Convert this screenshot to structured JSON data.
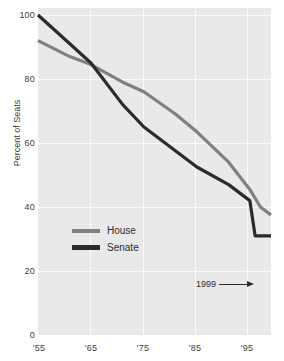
{
  "chart_data": {
    "type": "line",
    "title": "",
    "subtitle": "",
    "xlabel": "",
    "ylabel": "Percent of Seats",
    "xlim": [
      1955,
      1999
    ],
    "ylim": [
      0,
      100
    ],
    "grid": true,
    "legend_position": "inside-lower-left",
    "x_ticks": [
      "'55",
      "'65",
      "'75",
      "'85",
      "'95"
    ],
    "x_tick_values": [
      1955,
      1965,
      1975,
      1985,
      1995
    ],
    "y_ticks": [
      "0",
      "20",
      "40",
      "60",
      "80",
      "100"
    ],
    "y_tick_values": [
      0,
      20,
      40,
      60,
      80,
      100
    ],
    "annotations": [
      {
        "label": "1999",
        "target_x": 1999,
        "target_y": 15,
        "arrow": "right"
      }
    ],
    "series": [
      {
        "name": "House",
        "color": "#808080",
        "x": [
          1955,
          1961,
          1965,
          1971,
          1975,
          1981,
          1985,
          1991,
          1995,
          1997,
          1999
        ],
        "values": [
          92,
          87,
          84.5,
          79,
          76,
          69,
          63.5,
          54,
          45.5,
          40,
          37.5
        ]
      },
      {
        "name": "Senate",
        "color": "#2b2b2b",
        "x": [
          1955,
          1961,
          1965,
          1971,
          1975,
          1981,
          1985,
          1991,
          1995,
          1996,
          1999
        ],
        "values": [
          100,
          91,
          85,
          72,
          65,
          57.5,
          52.5,
          47,
          42,
          31,
          31
        ]
      }
    ]
  },
  "legend": {
    "items": [
      {
        "label": "House",
        "color": "#808080"
      },
      {
        "label": "Senate",
        "color": "#2b2b2b"
      }
    ]
  },
  "axes": {
    "y_axis_title": "Percent of Seats"
  },
  "colors": {
    "plot_background": "#e9e9e9",
    "gridline": "#fbfbfb",
    "house": "#808080",
    "senate": "#2b2b2b",
    "text": "#2b2b2b",
    "axis": "#9a9a9a"
  }
}
